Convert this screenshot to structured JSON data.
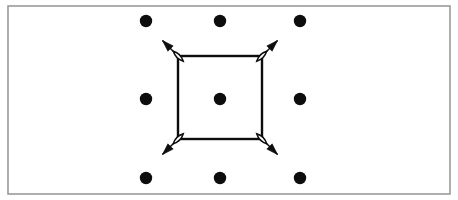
{
  "figure": {
    "canvas": {
      "width": 458,
      "height": 200,
      "background": "#ffffff"
    },
    "frame": {
      "label": "outer frame border",
      "x": 8,
      "y": 6,
      "width": 442,
      "height": 188,
      "stroke": "#9a9a9a",
      "stroke_width": 1.6,
      "fill": "#ffffff"
    },
    "lattice": {
      "label": "3 by 3 array of lattice point dots",
      "rows": 3,
      "columns": 3,
      "dot_color": "#0d0d0d",
      "dot_radius": 6.2,
      "x_positions": [
        146,
        220,
        300
      ],
      "y_positions": [
        21,
        99,
        178
      ],
      "points": [
        {
          "name": "lattice-dot-top-left",
          "cx": 146,
          "cy": 21
        },
        {
          "name": "lattice-dot-top-center",
          "cx": 220,
          "cy": 21
        },
        {
          "name": "lattice-dot-top-right",
          "cx": 300,
          "cy": 21
        },
        {
          "name": "lattice-dot-middle-left",
          "cx": 146,
          "cy": 99
        },
        {
          "name": "lattice-dot-center",
          "cx": 220,
          "cy": 99
        },
        {
          "name": "lattice-dot-middle-right",
          "cx": 300,
          "cy": 99
        },
        {
          "name": "lattice-dot-bottom-left",
          "cx": 146,
          "cy": 178
        },
        {
          "name": "lattice-dot-bottom-center",
          "cx": 220,
          "cy": 178
        },
        {
          "name": "lattice-dot-bottom-right",
          "cx": 300,
          "cy": 178
        }
      ]
    },
    "unit_cell": {
      "label": "unit cell square outline",
      "x": 178,
      "y": 56,
      "width": 84,
      "height": 83,
      "stroke": "#0d0d0d",
      "stroke_width": 2.4,
      "fill": "none",
      "corners": [
        {
          "name": "cell-corner-top-left",
          "cx": 178,
          "cy": 56
        },
        {
          "name": "cell-corner-top-right",
          "cx": 262,
          "cy": 56
        },
        {
          "name": "cell-corner-bottom-left",
          "cx": 178,
          "cy": 139
        },
        {
          "name": "cell-corner-bottom-right",
          "cx": 262,
          "cy": 139
        }
      ]
    },
    "arrows": {
      "label": "double headed displacement arrows at cell corners pointing outward",
      "count": 4,
      "stroke": "#0d0d0d",
      "stroke_width": 1.5,
      "head_fill": "#0d0d0d",
      "tail_fill": "#ffffff",
      "length": 22,
      "items": [
        {
          "name": "corner-arrow-top-left",
          "origin_x": 178,
          "origin_y": 56,
          "direction": "up-left",
          "angle_degrees": 225
        },
        {
          "name": "corner-arrow-top-right",
          "origin_x": 262,
          "origin_y": 56,
          "direction": "up-right",
          "angle_degrees": 315
        },
        {
          "name": "corner-arrow-bottom-left",
          "origin_x": 178,
          "origin_y": 139,
          "direction": "down-left",
          "angle_degrees": 135
        },
        {
          "name": "corner-arrow-bottom-right",
          "origin_x": 262,
          "origin_y": 139,
          "direction": "down-right",
          "angle_degrees": 45
        }
      ]
    }
  }
}
